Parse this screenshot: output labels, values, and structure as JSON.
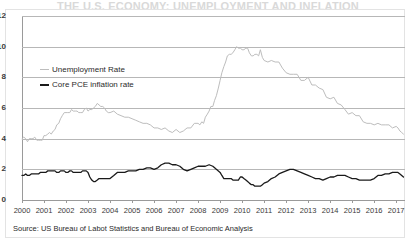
{
  "figure": {
    "title_partial": "THE U.S. ECONOMY: UNEMPLOYMENT AND INFLATION",
    "source_note": "Source: US Bureau of Labot Statistics and Bureau of Economic Analysis",
    "border_color": "#e3e3e3",
    "background": "#ffffff"
  },
  "legend": {
    "position": "inside-top-left",
    "items": [
      {
        "label": "Unemployment Rate",
        "color": "#bdbdbd",
        "swatch": "line-swatch"
      },
      {
        "label": "Core PCE inflation rate",
        "color": "#1a1a1a",
        "swatch": "line-swatch"
      }
    ]
  },
  "axes": {
    "y_ticks": [
      "0",
      "2",
      "4",
      "6",
      "8",
      "10",
      "12"
    ],
    "x_ticks": [
      "2000",
      "2001",
      "2002",
      "2003",
      "2004",
      "2005",
      "2006",
      "2007",
      "2008",
      "2009",
      "2010",
      "2011",
      "2012",
      "2013",
      "2014",
      "2015",
      "2016",
      "2017"
    ],
    "grid": "horizontal",
    "grid_color": "#b7b7b7",
    "axis_color": "#9a9a9a"
  },
  "chart_data": {
    "type": "line",
    "title": "THE U.S. ECONOMY: UNEMPLOYMENT AND INFLATION",
    "xlabel": "",
    "ylabel": "",
    "xlim": [
      2000,
      2017.4
    ],
    "ylim": [
      0,
      12
    ],
    "ytick_step": 2,
    "grid": true,
    "legend_position": "upper-left-inside",
    "x_unit": "year (monthly observations)",
    "y_unit": "percent",
    "categories": [
      "2000",
      "2001",
      "2002",
      "2003",
      "2004",
      "2005",
      "2006",
      "2007",
      "2008",
      "2009",
      "2010",
      "2011",
      "2012",
      "2013",
      "2014",
      "2015",
      "2016",
      "2017"
    ],
    "series": [
      {
        "name": "Unemployment Rate",
        "color": "#bdbdbd",
        "x": [
          2000.0,
          2000.08,
          2000.17,
          2000.25,
          2000.33,
          2000.42,
          2000.5,
          2000.58,
          2000.67,
          2000.75,
          2000.83,
          2000.92,
          2001.0,
          2001.08,
          2001.17,
          2001.25,
          2001.33,
          2001.42,
          2001.5,
          2001.58,
          2001.67,
          2001.75,
          2001.83,
          2001.92,
          2002.0,
          2002.08,
          2002.17,
          2002.25,
          2002.33,
          2002.42,
          2002.5,
          2002.58,
          2002.67,
          2002.75,
          2002.83,
          2002.92,
          2003.0,
          2003.08,
          2003.17,
          2003.25,
          2003.33,
          2003.42,
          2003.5,
          2003.58,
          2003.67,
          2003.75,
          2003.83,
          2003.92,
          2004.0,
          2004.17,
          2004.33,
          2004.5,
          2004.67,
          2004.83,
          2005.0,
          2005.17,
          2005.33,
          2005.5,
          2005.67,
          2005.83,
          2006.0,
          2006.17,
          2006.33,
          2006.5,
          2006.67,
          2006.83,
          2007.0,
          2007.17,
          2007.33,
          2007.5,
          2007.67,
          2007.83,
          2008.0,
          2008.08,
          2008.17,
          2008.25,
          2008.33,
          2008.42,
          2008.5,
          2008.58,
          2008.67,
          2008.75,
          2008.83,
          2008.92,
          2009.0,
          2009.08,
          2009.17,
          2009.25,
          2009.33,
          2009.42,
          2009.5,
          2009.58,
          2009.67,
          2009.75,
          2009.83,
          2009.92,
          2010.0,
          2010.08,
          2010.17,
          2010.25,
          2010.33,
          2010.42,
          2010.5,
          2010.58,
          2010.67,
          2010.75,
          2010.83,
          2010.92,
          2011.0,
          2011.17,
          2011.33,
          2011.5,
          2011.67,
          2011.83,
          2012.0,
          2012.17,
          2012.33,
          2012.5,
          2012.67,
          2012.83,
          2013.0,
          2013.17,
          2013.33,
          2013.5,
          2013.67,
          2013.83,
          2014.0,
          2014.17,
          2014.33,
          2014.5,
          2014.67,
          2014.83,
          2015.0,
          2015.17,
          2015.33,
          2015.5,
          2015.67,
          2015.83,
          2016.0,
          2016.17,
          2016.33,
          2016.5,
          2016.67,
          2016.83,
          2017.0,
          2017.08,
          2017.17,
          2017.25,
          2017.33
        ],
        "values": [
          4.0,
          4.1,
          4.0,
          3.8,
          4.0,
          4.0,
          4.0,
          4.1,
          3.9,
          3.9,
          3.9,
          3.9,
          4.2,
          4.2,
          4.3,
          4.4,
          4.3,
          4.5,
          4.6,
          4.9,
          5.0,
          5.3,
          5.5,
          5.7,
          5.7,
          5.7,
          5.7,
          5.9,
          5.8,
          5.8,
          5.8,
          5.7,
          5.7,
          5.7,
          5.9,
          6.0,
          5.8,
          5.9,
          5.9,
          6.0,
          6.1,
          6.3,
          6.2,
          6.1,
          6.1,
          6.0,
          5.8,
          5.7,
          5.7,
          5.8,
          5.6,
          5.5,
          5.4,
          5.4,
          5.3,
          5.2,
          5.1,
          5.0,
          5.0,
          4.9,
          4.7,
          4.7,
          4.6,
          4.7,
          4.5,
          4.4,
          4.6,
          4.4,
          4.5,
          4.7,
          4.7,
          5.0,
          5.0,
          4.9,
          5.1,
          5.0,
          5.4,
          5.6,
          5.8,
          6.1,
          6.1,
          6.5,
          6.8,
          7.3,
          7.8,
          8.3,
          8.7,
          9.0,
          9.4,
          9.5,
          9.5,
          9.6,
          9.8,
          10.0,
          9.9,
          9.9,
          9.8,
          9.8,
          9.9,
          9.9,
          9.6,
          9.4,
          9.4,
          9.5,
          9.5,
          9.4,
          9.8,
          9.3,
          9.1,
          9.0,
          9.1,
          9.0,
          9.0,
          8.6,
          8.3,
          8.2,
          8.2,
          8.2,
          7.8,
          7.8,
          8.0,
          7.5,
          7.5,
          7.3,
          7.2,
          6.7,
          6.6,
          6.7,
          6.3,
          6.2,
          5.9,
          5.6,
          5.7,
          5.5,
          5.5,
          5.1,
          5.0,
          5.0,
          4.9,
          5.0,
          4.9,
          4.9,
          4.9,
          4.7,
          4.8,
          4.7,
          4.5,
          4.4,
          4.3
        ]
      },
      {
        "name": "Core PCE inflation rate",
        "color": "#1a1a1a",
        "x": [
          2000.0,
          2000.08,
          2000.17,
          2000.25,
          2000.33,
          2000.42,
          2000.5,
          2000.58,
          2000.67,
          2000.75,
          2000.83,
          2000.92,
          2001.0,
          2001.08,
          2001.17,
          2001.25,
          2001.33,
          2001.42,
          2001.5,
          2001.58,
          2001.67,
          2001.75,
          2001.83,
          2001.92,
          2002.0,
          2002.08,
          2002.17,
          2002.25,
          2002.33,
          2002.42,
          2002.5,
          2002.58,
          2002.67,
          2002.75,
          2002.83,
          2002.92,
          2003.0,
          2003.08,
          2003.17,
          2003.25,
          2003.33,
          2003.42,
          2003.5,
          2003.58,
          2003.67,
          2003.75,
          2003.83,
          2003.92,
          2004.0,
          2004.17,
          2004.33,
          2004.5,
          2004.67,
          2004.83,
          2005.0,
          2005.17,
          2005.33,
          2005.5,
          2005.67,
          2005.83,
          2006.0,
          2006.17,
          2006.33,
          2006.5,
          2006.67,
          2006.83,
          2007.0,
          2007.17,
          2007.33,
          2007.5,
          2007.67,
          2007.83,
          2008.0,
          2008.17,
          2008.33,
          2008.5,
          2008.67,
          2008.83,
          2009.0,
          2009.08,
          2009.17,
          2009.25,
          2009.33,
          2009.42,
          2009.5,
          2009.58,
          2009.67,
          2009.75,
          2009.83,
          2009.92,
          2010.0,
          2010.08,
          2010.17,
          2010.25,
          2010.33,
          2010.42,
          2010.5,
          2010.58,
          2010.67,
          2010.75,
          2010.83,
          2010.92,
          2011.0,
          2011.17,
          2011.33,
          2011.5,
          2011.67,
          2011.83,
          2012.0,
          2012.17,
          2012.33,
          2012.5,
          2012.67,
          2012.83,
          2013.0,
          2013.17,
          2013.33,
          2013.5,
          2013.67,
          2013.83,
          2014.0,
          2014.17,
          2014.33,
          2014.5,
          2014.67,
          2014.83,
          2015.0,
          2015.17,
          2015.33,
          2015.5,
          2015.67,
          2015.83,
          2016.0,
          2016.17,
          2016.33,
          2016.5,
          2016.67,
          2016.83,
          2017.0,
          2017.08,
          2017.17,
          2017.25,
          2017.33
        ],
        "values": [
          1.6,
          1.6,
          1.7,
          1.6,
          1.6,
          1.7,
          1.7,
          1.7,
          1.7,
          1.7,
          1.8,
          1.8,
          1.8,
          1.8,
          1.9,
          1.9,
          1.9,
          1.9,
          1.9,
          1.8,
          1.8,
          1.9,
          1.9,
          1.9,
          1.8,
          1.8,
          1.9,
          1.9,
          1.8,
          1.8,
          1.8,
          1.8,
          1.8,
          1.9,
          1.9,
          1.9,
          1.8,
          1.5,
          1.3,
          1.2,
          1.2,
          1.3,
          1.4,
          1.4,
          1.4,
          1.4,
          1.4,
          1.4,
          1.4,
          1.6,
          1.8,
          1.8,
          1.8,
          1.9,
          1.9,
          1.9,
          2.0,
          2.0,
          2.1,
          2.1,
          2.0,
          2.1,
          2.3,
          2.4,
          2.4,
          2.3,
          2.3,
          2.2,
          2.0,
          1.9,
          2.0,
          2.1,
          2.2,
          2.2,
          2.2,
          2.3,
          2.2,
          2.0,
          1.8,
          1.6,
          1.4,
          1.4,
          1.4,
          1.4,
          1.4,
          1.3,
          1.3,
          1.3,
          1.3,
          1.5,
          1.5,
          1.4,
          1.3,
          1.2,
          1.1,
          1.0,
          1.0,
          0.9,
          0.9,
          0.9,
          0.9,
          1.0,
          1.1,
          1.2,
          1.4,
          1.5,
          1.7,
          1.8,
          1.9,
          2.0,
          2.0,
          1.9,
          1.8,
          1.7,
          1.6,
          1.5,
          1.4,
          1.4,
          1.3,
          1.4,
          1.5,
          1.5,
          1.6,
          1.6,
          1.6,
          1.5,
          1.4,
          1.4,
          1.3,
          1.3,
          1.3,
          1.3,
          1.4,
          1.6,
          1.6,
          1.7,
          1.7,
          1.8,
          1.8,
          1.8,
          1.7,
          1.6,
          1.5
        ]
      }
    ]
  }
}
